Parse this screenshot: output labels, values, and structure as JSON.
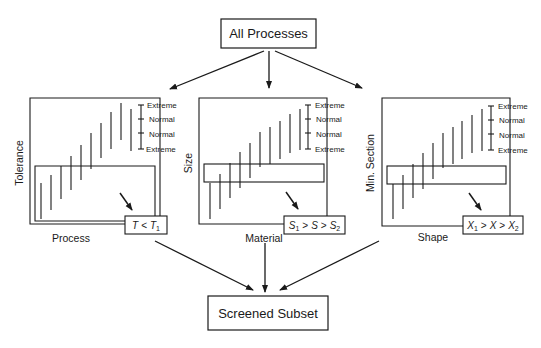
{
  "nodes": {
    "top": {
      "label": "All Processes"
    },
    "bottom": {
      "label": "Screened Subset"
    }
  },
  "panels": [
    {
      "id": "tolerance",
      "y_label": "Tolerance",
      "x_label": "Process",
      "condition": {
        "var": "T",
        "op1": "<",
        "rhs": "T",
        "rhs_sub": "1"
      },
      "scale": [
        "Extreme",
        "Normal",
        "Normal",
        "Extreme"
      ]
    },
    {
      "id": "size",
      "y_label": "Size",
      "x_label": "Material",
      "condition": {
        "lhs": "S",
        "lhs_sub": "1",
        "op1": ">",
        "var": "S",
        "op2": ">",
        "rhs": "S",
        "rhs_sub": "2"
      },
      "scale": [
        "Extreme",
        "Normal",
        "Normal",
        "Extreme"
      ]
    },
    {
      "id": "min-section",
      "y_label": "Min. Section",
      "x_label": "Shape",
      "condition": {
        "lhs": "X",
        "lhs_sub": "1",
        "op1": ">",
        "var": "X",
        "op2": ">",
        "rhs": "X",
        "rhs_sub": "2"
      },
      "scale": [
        "Extreme",
        "Normal",
        "Normal",
        "Extreme"
      ]
    }
  ],
  "colors": {
    "ink": "#1a1a1a",
    "background": "#ffffff"
  }
}
